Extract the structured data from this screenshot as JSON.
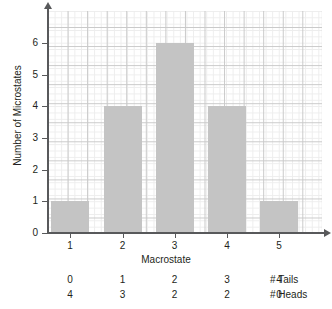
{
  "chart_data": {
    "type": "bar",
    "title": "",
    "xlabel": "Macrostate",
    "ylabel": "Number of Microstates",
    "categories": [
      "1",
      "2",
      "3",
      "4",
      "5"
    ],
    "values": [
      1,
      4,
      6,
      4,
      1
    ],
    "ylim": [
      0,
      7
    ],
    "yticks": [
      0,
      1,
      2,
      3,
      4,
      5,
      6
    ],
    "ytick_labels": [
      "0",
      "1",
      "2",
      "3",
      "4",
      "5",
      "6"
    ],
    "xtick_labels": [
      "1",
      "2",
      "3",
      "4",
      "5"
    ],
    "grid": true,
    "legend": "none",
    "bar_color": "#c4c4c4",
    "axis_color": "#58595b",
    "grid_major_color": "#c9c9c9",
    "grid_minor_color": "#ededed",
    "annotation_rows": [
      {
        "name": "# Tails",
        "values": [
          "0",
          "1",
          "2",
          "3",
          "4"
        ]
      },
      {
        "name": "# Heads",
        "values": [
          "4",
          "3",
          "2",
          "2",
          "0"
        ]
      }
    ]
  }
}
